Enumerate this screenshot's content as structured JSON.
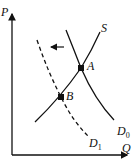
{
  "diagram": {
    "type": "supply-demand",
    "axes": {
      "y_label": "P",
      "x_label": "Q"
    },
    "curves": [
      {
        "id": "S",
        "label": "S",
        "style": "solid"
      },
      {
        "id": "D0",
        "label": "D",
        "subscript": "0",
        "style": "solid"
      },
      {
        "id": "D1",
        "label": "D",
        "subscript": "1",
        "style": "dashed"
      }
    ],
    "points": [
      {
        "id": "A",
        "label": "A",
        "on": [
          "S",
          "D0"
        ]
      },
      {
        "id": "B",
        "label": "B",
        "on": [
          "S",
          "D1"
        ]
      }
    ],
    "shift_arrow": {
      "direction": "left",
      "meaning": "demand shifts from D0 to D1"
    }
  }
}
